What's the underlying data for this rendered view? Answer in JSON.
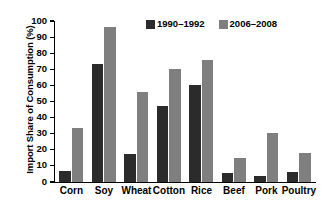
{
  "chart_data": {
    "type": "bar",
    "title": "",
    "xlabel": "",
    "ylabel": "Import Share of Consumption (%)",
    "ylim": [
      0,
      100
    ],
    "yticks": [
      0,
      10,
      20,
      30,
      40,
      50,
      60,
      70,
      80,
      90,
      100
    ],
    "grid": false,
    "legend_position": "top-center",
    "categories": [
      "Corn",
      "Soy",
      "Wheat",
      "Cotton",
      "Rice",
      "Beef",
      "Pork",
      "Poultry"
    ],
    "series": [
      {
        "name": "1990–1992",
        "color": "#2b2b2b",
        "values": [
          7,
          73.5,
          17.5,
          47.5,
          60,
          5.5,
          4,
          6.5
        ]
      },
      {
        "name": "2006–2008",
        "color": "#7f7f7f",
        "values": [
          33.5,
          96.5,
          56,
          70,
          75.5,
          15,
          30.5,
          18
        ]
      }
    ]
  }
}
